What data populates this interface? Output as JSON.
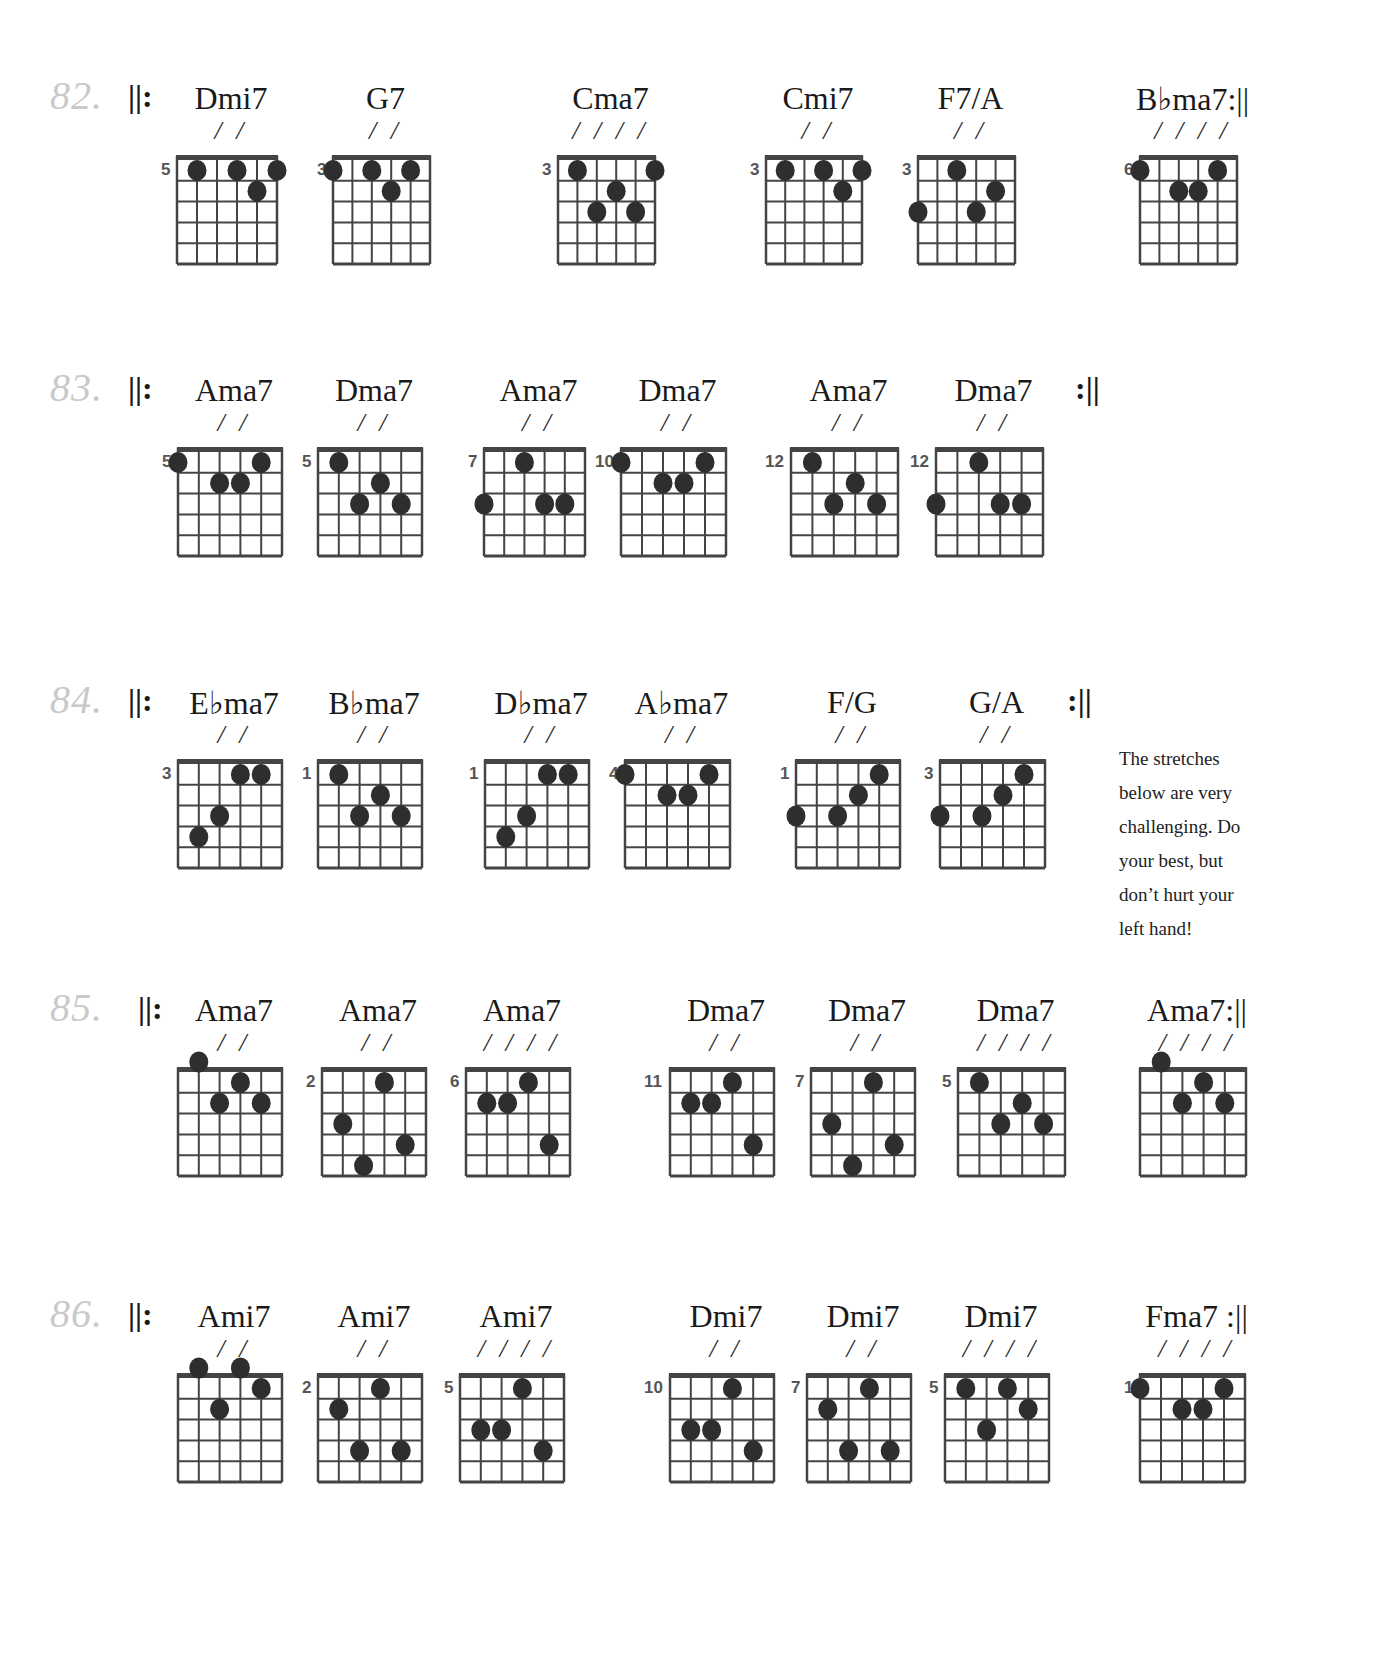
{
  "page": {
    "note": [
      "The stretches",
      "below are very",
      "challenging. Do",
      "your best, but",
      "don’t hurt your",
      "left hand!"
    ],
    "repeat_start": "||:",
    "repeat_end": ":||",
    "colors": {
      "ink": "#1a1a1a",
      "grid": "#444444",
      "dot": "#2e2e2e",
      "exercise_number": "#c9c9c9"
    }
  },
  "exercises": [
    {
      "number": "82.",
      "y": 80,
      "repeat_start_x": 128,
      "repeat_end_after": "Bbma7",
      "chords": [
        {
          "name": "Dmi7",
          "slashes": "/ /",
          "fret": "5",
          "x": 177,
          "w": 100,
          "dots": [
            [
              2,
              1
            ],
            [
              4,
              1
            ],
            [
              6,
              1
            ],
            [
              5,
              2
            ]
          ]
        },
        {
          "name": "G7",
          "slashes": "/ /",
          "fret": "3",
          "x": 333,
          "w": 97,
          "dots": [
            [
              1,
              1
            ],
            [
              3,
              1
            ],
            [
              5,
              1
            ],
            [
              4,
              2
            ]
          ]
        },
        {
          "name": "Cma7",
          "slashes": "/ / / /",
          "fret": "3",
          "x": 558,
          "w": 97,
          "dots": [
            [
              2,
              1
            ],
            [
              6,
              1
            ],
            [
              4,
              2
            ],
            [
              3,
              3
            ],
            [
              5,
              3
            ]
          ]
        },
        {
          "name": "Cmi7",
          "slashes": "/ /",
          "fret": "3",
          "x": 766,
          "w": 96,
          "dots": [
            [
              2,
              1
            ],
            [
              4,
              1
            ],
            [
              6,
              1
            ],
            [
              5,
              2
            ]
          ]
        },
        {
          "name": "F7/A",
          "slashes": "/ /",
          "fret": "3",
          "x": 918,
          "w": 97,
          "dots": [
            [
              3,
              1
            ],
            [
              5,
              2
            ],
            [
              1,
              3
            ],
            [
              4,
              3
            ]
          ]
        },
        {
          "name": "B♭ma7:||",
          "slashes": "/ / / /",
          "fret": "6",
          "x": 1140,
          "w": 97,
          "dots": [
            [
              1,
              1
            ],
            [
              5,
              1
            ],
            [
              3,
              2
            ],
            [
              4,
              2
            ]
          ]
        }
      ]
    },
    {
      "number": "83.",
      "y": 372,
      "repeat_start_x": 128,
      "repeat_end_x": 1075,
      "chords": [
        {
          "name": "Ama7",
          "slashes": "/ /",
          "fret": "5",
          "x": 178,
          "w": 104,
          "dots": [
            [
              1,
              1
            ],
            [
              5,
              1
            ],
            [
              3,
              2
            ],
            [
              4,
              2
            ]
          ]
        },
        {
          "name": "Dma7",
          "slashes": "/ /",
          "fret": "5",
          "x": 318,
          "w": 104,
          "dots": [
            [
              2,
              1
            ],
            [
              4,
              2
            ],
            [
              3,
              3
            ],
            [
              5,
              3
            ]
          ]
        },
        {
          "name": "Ama7",
          "slashes": "/ /",
          "fret": "7",
          "x": 484,
          "w": 101,
          "dots": [
            [
              3,
              1
            ],
            [
              1,
              3
            ],
            [
              4,
              3
            ],
            [
              5,
              3
            ]
          ]
        },
        {
          "name": "Dma7",
          "slashes": "/ /",
          "fret": "10",
          "x": 621,
          "w": 105,
          "dots": [
            [
              1,
              1
            ],
            [
              5,
              1
            ],
            [
              3,
              2
            ],
            [
              4,
              2
            ]
          ]
        },
        {
          "name": "Ama7",
          "slashes": "/ /",
          "fret": "12",
          "x": 791,
          "w": 107,
          "dots": [
            [
              2,
              1
            ],
            [
              4,
              2
            ],
            [
              3,
              3
            ],
            [
              5,
              3
            ]
          ]
        },
        {
          "name": "Dma7",
          "slashes": "/ /",
          "fret": "12",
          "x": 936,
          "w": 107,
          "dots": [
            [
              3,
              1
            ],
            [
              1,
              3
            ],
            [
              4,
              3
            ],
            [
              5,
              3
            ]
          ]
        }
      ]
    },
    {
      "number": "84.",
      "y": 684,
      "repeat_start_x": 128,
      "repeat_end_x": 1067,
      "chords": [
        {
          "name": "E♭ma7",
          "slashes": "/ /",
          "fret": "3",
          "x": 178,
          "w": 104,
          "dots": [
            [
              4,
              1
            ],
            [
              5,
              1
            ],
            [
              3,
              3
            ],
            [
              2,
              4
            ]
          ]
        },
        {
          "name": "B♭ma7",
          "slashes": "/ /",
          "fret": "1",
          "x": 318,
          "w": 104,
          "dots": [
            [
              2,
              1
            ],
            [
              4,
              2
            ],
            [
              3,
              3
            ],
            [
              5,
              3
            ]
          ]
        },
        {
          "name": "D♭ma7",
          "slashes": "/ /",
          "fret": "1",
          "x": 485,
          "w": 104,
          "dots": [
            [
              4,
              1
            ],
            [
              5,
              1
            ],
            [
              3,
              3
            ],
            [
              2,
              4
            ]
          ]
        },
        {
          "name": "A♭ma7",
          "slashes": "/ /",
          "fret": "4",
          "x": 625,
          "w": 105,
          "dots": [
            [
              1,
              1
            ],
            [
              5,
              1
            ],
            [
              3,
              2
            ],
            [
              4,
              2
            ]
          ]
        },
        {
          "name": "F/G",
          "slashes": "/ /",
          "fret": "1",
          "x": 796,
          "w": 104,
          "dots": [
            [
              5,
              1
            ],
            [
              4,
              2
            ],
            [
              1,
              3
            ],
            [
              3,
              3
            ]
          ]
        },
        {
          "name": "G/A",
          "slashes": "/ /",
          "fret": "3",
          "x": 940,
          "w": 105,
          "dots": [
            [
              5,
              1
            ],
            [
              4,
              2
            ],
            [
              1,
              3
            ],
            [
              3,
              3
            ]
          ]
        }
      ]
    },
    {
      "number": "85.",
      "y": 992,
      "repeat_start_x": 138,
      "repeat_end_after": "Ama7-last",
      "chords": [
        {
          "name": "Ama7",
          "slashes": "/ /",
          "fret": "",
          "x": 178,
          "w": 104,
          "dots": [
            [
              2,
              0
            ],
            [
              4,
              1
            ],
            [
              3,
              2
            ],
            [
              5,
              2
            ]
          ]
        },
        {
          "name": "Ama7",
          "slashes": "/ /",
          "fret": "2",
          "x": 322,
          "w": 104,
          "dots": [
            [
              4,
              1
            ],
            [
              2,
              3
            ],
            [
              5,
              4
            ],
            [
              3,
              5
            ]
          ]
        },
        {
          "name": "Ama7",
          "slashes": "/ / / /",
          "fret": "6",
          "x": 466,
          "w": 104,
          "dots": [
            [
              4,
              1
            ],
            [
              2,
              2
            ],
            [
              3,
              2
            ],
            [
              5,
              4
            ]
          ]
        },
        {
          "name": "Dma7",
          "slashes": "/ /",
          "fret": "11",
          "x": 670,
          "w": 104,
          "dots": [
            [
              4,
              1
            ],
            [
              2,
              2
            ],
            [
              3,
              2
            ],
            [
              5,
              4
            ]
          ]
        },
        {
          "name": "Dma7",
          "slashes": "/ /",
          "fret": "7",
          "x": 811,
          "w": 104,
          "dots": [
            [
              4,
              1
            ],
            [
              2,
              3
            ],
            [
              5,
              4
            ],
            [
              3,
              5
            ]
          ]
        },
        {
          "name": "Dma7",
          "slashes": "/ / / /",
          "fret": "5",
          "x": 958,
          "w": 107,
          "dots": [
            [
              2,
              1
            ],
            [
              4,
              2
            ],
            [
              3,
              3
            ],
            [
              5,
              3
            ]
          ]
        },
        {
          "name": "Ama7:||",
          "slashes": "/ / / /",
          "fret": "",
          "x": 1140,
          "w": 106,
          "dots": [
            [
              2,
              0
            ],
            [
              4,
              1
            ],
            [
              3,
              2
            ],
            [
              5,
              2
            ]
          ]
        }
      ]
    },
    {
      "number": "86.",
      "y": 1298,
      "repeat_start_x": 128,
      "repeat_end_after": "Fma7",
      "chords": [
        {
          "name": "Ami7",
          "slashes": "/ /",
          "fret": "",
          "x": 178,
          "w": 104,
          "dots": [
            [
              2,
              0
            ],
            [
              4,
              0
            ],
            [
              5,
              1
            ],
            [
              3,
              2
            ]
          ]
        },
        {
          "name": "Ami7",
          "slashes": "/ /",
          "fret": "2",
          "x": 318,
          "w": 104,
          "dots": [
            [
              4,
              1
            ],
            [
              2,
              2
            ],
            [
              3,
              4
            ],
            [
              5,
              4
            ]
          ]
        },
        {
          "name": "Ami7",
          "slashes": "/ / / /",
          "fret": "5",
          "x": 460,
          "w": 104,
          "dots": [
            [
              4,
              1
            ],
            [
              2,
              3
            ],
            [
              3,
              3
            ],
            [
              5,
              4
            ]
          ]
        },
        {
          "name": "Dmi7",
          "slashes": "/ /",
          "fret": "10",
          "x": 670,
          "w": 104,
          "dots": [
            [
              4,
              1
            ],
            [
              2,
              3
            ],
            [
              3,
              3
            ],
            [
              5,
              4
            ]
          ]
        },
        {
          "name": "Dmi7",
          "slashes": "/ /",
          "fret": "7",
          "x": 807,
          "w": 104,
          "dots": [
            [
              4,
              1
            ],
            [
              2,
              2
            ],
            [
              3,
              4
            ],
            [
              5,
              4
            ]
          ]
        },
        {
          "name": "Dmi7",
          "slashes": "/ / / /",
          "fret": "5",
          "x": 945,
          "w": 104,
          "dots": [
            [
              2,
              1
            ],
            [
              4,
              1
            ],
            [
              5,
              2
            ],
            [
              3,
              3
            ]
          ]
        },
        {
          "name": "Fma7 :||",
          "slashes": "/ / / /",
          "fret": "1",
          "x": 1140,
          "w": 105,
          "dots": [
            [
              1,
              1
            ],
            [
              5,
              1
            ],
            [
              3,
              2
            ],
            [
              4,
              2
            ]
          ]
        }
      ]
    }
  ]
}
